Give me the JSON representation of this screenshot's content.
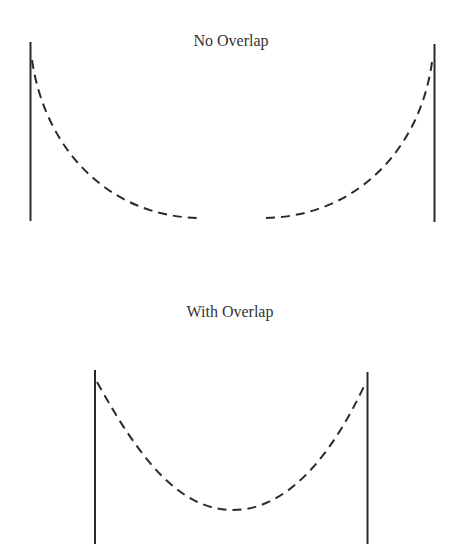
{
  "panels": [
    {
      "title": "No Overlap"
    },
    {
      "title": "With Overlap"
    }
  ],
  "colors": {
    "line": "#2a2a2a",
    "text": "#333333",
    "background": "#ffffff"
  }
}
